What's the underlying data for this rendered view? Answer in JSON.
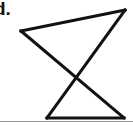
{
  "figure": {
    "item_label": "d.",
    "background_color": "#ffffff",
    "stroke_color": "#111111",
    "stroke_width": 3,
    "rule_color": "#9a9a9a",
    "width": 133,
    "height": 125,
    "vertices": {
      "left": {
        "label": "A",
        "x": 21,
        "y": 31
      },
      "top_right": {
        "label": "B",
        "x": 125,
        "y": 10
      },
      "bottom_left": {
        "label": "C",
        "x": 47,
        "y": 118
      },
      "bottom_right": {
        "label": "D",
        "x": 124,
        "y": 118
      }
    },
    "crossing_point": {
      "x": 79,
      "y": 78
    },
    "segments": [
      {
        "name": "top-edge",
        "from": "left",
        "to": "top_right",
        "points": "21,31 125,10"
      },
      {
        "name": "left-diagonal",
        "from": "left",
        "to": "bottom_right",
        "points": "21,31 124,118"
      },
      {
        "name": "right-diagonal",
        "from": "top_right",
        "to": "bottom_left",
        "points": "125,10 47,118"
      },
      {
        "name": "bottom-edge",
        "from": "bottom_left",
        "to": "bottom_right",
        "points": "47,118 124,118"
      }
    ]
  }
}
